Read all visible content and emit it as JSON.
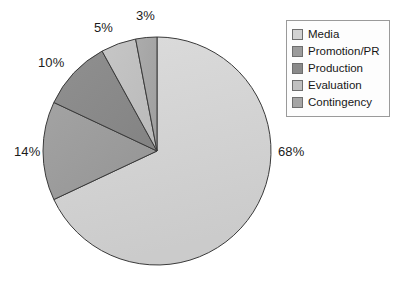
{
  "chart_data": {
    "type": "pie",
    "title": "",
    "labels": [
      "Media",
      "Promotion/PR",
      "Production",
      "Evaluation",
      "Contingency"
    ],
    "values": [
      68,
      14,
      10,
      5,
      3
    ],
    "value_labels": [
      "68%",
      "14%",
      "10%",
      "5%",
      "3%"
    ],
    "unit": "%",
    "colors": [
      "#d2d2d2",
      "#9b9b9b",
      "#8a8a8a",
      "#c0c0c0",
      "#a5a5a5"
    ],
    "start_angle_deg": 0,
    "direction": "clockwise",
    "legend_position": "right",
    "grid": false
  },
  "legend": {
    "entries": [
      {
        "label": "Media",
        "color": "#d2d2d2"
      },
      {
        "label": "Promotion/PR",
        "color": "#9b9b9b"
      },
      {
        "label": "Production",
        "color": "#8a8a8a"
      },
      {
        "label": "Evaluation",
        "color": "#c0c0c0"
      },
      {
        "label": "Contingency",
        "color": "#a5a5a5"
      }
    ]
  },
  "callouts": {
    "media": "68%",
    "promotion": "14%",
    "production": "10%",
    "evaluation": "5%",
    "contingency": "3%"
  },
  "geometry": {
    "center_x": 157,
    "center_y": 151,
    "radius": 114
  },
  "style": {
    "outline_color": "#3a3a3a",
    "background": "#ffffff",
    "label_color": "#1b1b1b"
  }
}
